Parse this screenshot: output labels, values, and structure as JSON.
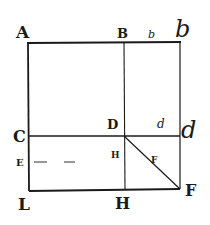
{
  "diagram": {
    "type": "geometric-figure",
    "stroke_color": "#1a1a1a",
    "background": "#ffffff",
    "labels": {
      "A": "A",
      "B": "B",
      "b_small": "b",
      "b_large": "b",
      "C": "C",
      "D": "D",
      "d_small": "d",
      "d_large": "d",
      "E": "E",
      "H_inner": "H",
      "F_inner": "F",
      "L": "L",
      "H": "H",
      "F": "F"
    },
    "points": {
      "A": [
        28,
        43
      ],
      "B": [
        124,
        43
      ],
      "b": [
        180,
        43
      ],
      "C": [
        28,
        136
      ],
      "D": [
        124,
        136
      ],
      "d": [
        180,
        136
      ],
      "L": [
        28,
        190
      ],
      "H": [
        124,
        190
      ],
      "F": [
        180,
        190
      ]
    },
    "segments": [
      {
        "from": "A",
        "to": "b",
        "name": "top-edge"
      },
      {
        "from": "A",
        "to": "L",
        "name": "left-edge"
      },
      {
        "from": "b",
        "to": "F",
        "name": "right-edge"
      },
      {
        "from": "L",
        "to": "F",
        "name": "bottom-edge"
      },
      {
        "from": "B",
        "to": "H",
        "name": "vertical-divider"
      },
      {
        "from": "C",
        "to": "d",
        "name": "horizontal-divider"
      },
      {
        "from": "D",
        "to": "F",
        "name": "diagonal-DF"
      }
    ],
    "dashed_segment": {
      "from": [
        33,
        162
      ],
      "to": [
        75,
        162
      ],
      "name": "E-dashes"
    }
  }
}
